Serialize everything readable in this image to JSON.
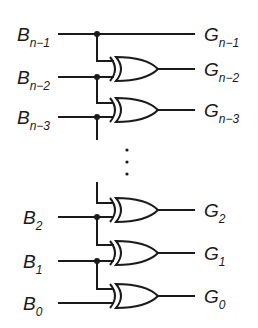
{
  "colors": {
    "stroke": "#1a1a1a",
    "background": "#ffffff"
  },
  "inputs": [
    {
      "base": "B",
      "sub": "n−1"
    },
    {
      "base": "B",
      "sub": "n−2"
    },
    {
      "base": "B",
      "sub": "n−3"
    },
    {
      "base": "B",
      "sub": "2"
    },
    {
      "base": "B",
      "sub": "1"
    },
    {
      "base": "B",
      "sub": "0"
    }
  ],
  "outputs": [
    {
      "base": "G",
      "sub": "n−1"
    },
    {
      "base": "G",
      "sub": "n−2"
    },
    {
      "base": "G",
      "sub": "n−3"
    },
    {
      "base": "G",
      "sub": "2"
    },
    {
      "base": "G",
      "sub": "1"
    },
    {
      "base": "G",
      "sub": "0"
    }
  ],
  "gate_type": "XOR",
  "ellipsis": "⋮"
}
